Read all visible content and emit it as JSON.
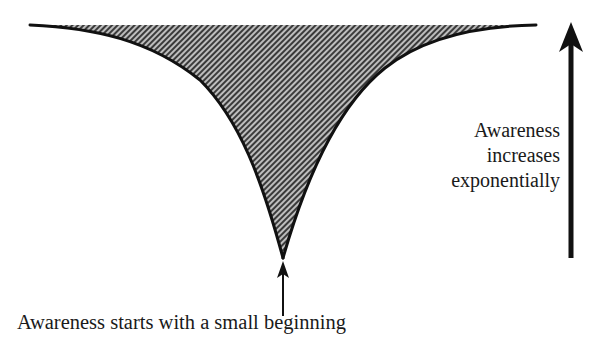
{
  "diagram": {
    "shape": {
      "type": "inverted-exponential-funnel",
      "fill_pattern": "diagonal-hatch",
      "fill_color": "#8a8a8a",
      "stroke_color": "#111111"
    },
    "right_label": {
      "lines": [
        "Awareness",
        "increases",
        "exponentially"
      ]
    },
    "bottom_label": {
      "text": "Awareness starts with a small beginning"
    },
    "arrows": [
      {
        "name": "growth-arrow",
        "direction": "up",
        "size": "large"
      },
      {
        "name": "start-arrow",
        "direction": "up",
        "size": "small"
      }
    ]
  }
}
